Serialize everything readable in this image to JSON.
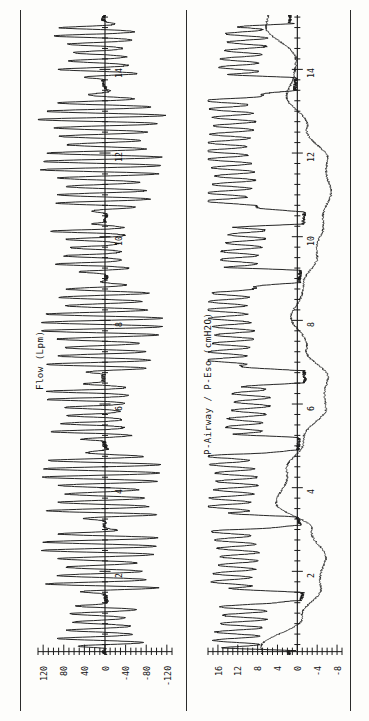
{
  "figure": {
    "kind": "physiological-recording",
    "orientation": "rotated-90-ccw",
    "background": "#fdfdfb",
    "ink": "#1a1a1a"
  },
  "panels": [
    {
      "id": "flow",
      "axis_title": "Flow (Lpm)",
      "amp_ticks": [
        "120",
        "80",
        "40",
        "0",
        "-40",
        "-80",
        "-120"
      ],
      "amp_tick_values": [
        120,
        80,
        40,
        0,
        -40,
        -80,
        -120
      ],
      "amp_minor_per_major": 4,
      "time_labels": [
        "2",
        "4",
        "6",
        "8",
        "10",
        "12",
        "14"
      ],
      "time_label_values": [
        2,
        4,
        6,
        8,
        10,
        12,
        14
      ]
    },
    {
      "id": "pressure",
      "axis_title": "P-Airway / P-Eso (cmH2O)",
      "amp_ticks": [
        "16",
        "12",
        "8",
        "4",
        "0",
        "-4",
        "-8"
      ],
      "amp_tick_values": [
        16,
        12,
        8,
        4,
        0,
        -4,
        -8
      ],
      "amp_minor_per_major": 4,
      "time_labels": [
        "2",
        "4",
        "6",
        "8",
        "10",
        "12",
        "14"
      ],
      "time_label_values": [
        2,
        4,
        6,
        8,
        10,
        12,
        14
      ]
    }
  ],
  "chart_data": {
    "type": "line",
    "title": "",
    "subtitle": "",
    "layout": {
      "panels": 2,
      "shared_axis": "time",
      "time_axis_orientation": "vertical-bottom-to-top",
      "amplitude_axis_orientation": "horizontal",
      "grid": false,
      "legend": "none",
      "frame": "left-and-right-vertical-rules"
    },
    "xlabel": "Time (s)",
    "xlim": [
      0,
      15.3
    ],
    "xticks": [
      2,
      4,
      6,
      8,
      10,
      12,
      14
    ],
    "panel_flow": {
      "ylabel": "Flow (Lpm)",
      "ylim": [
        -130,
        130
      ],
      "yticks": [
        -120,
        -80,
        -40,
        0,
        40,
        80,
        120
      ],
      "series": [
        {
          "name": "Flow",
          "description": "High-frequency oscillatory ventilation flow; bursts of ~5 Hz oscillation separated by quieter inter-burst segments. Amplitude modulated envelope.",
          "breath_bursts": [
            {
              "t_start": 0.15,
              "t_end": 1.25,
              "peak_pos": 95,
              "peak_neg": -70,
              "osc_hz": 5.1
            },
            {
              "t_start": 1.45,
              "t_end": 3.05,
              "peak_pos": 120,
              "peak_neg": -105,
              "osc_hz": 5.0
            },
            {
              "t_start": 3.2,
              "t_end": 4.95,
              "peak_pos": 118,
              "peak_neg": -112,
              "osc_hz": 5.0
            },
            {
              "t_start": 5.1,
              "t_end": 6.55,
              "peak_pos": 112,
              "peak_neg": -48,
              "osc_hz": 5.2
            },
            {
              "t_start": 6.7,
              "t_end": 8.95,
              "peak_pos": 122,
              "peak_neg": -116,
              "osc_hz": 5.0
            },
            {
              "t_start": 9.1,
              "t_end": 10.35,
              "peak_pos": 104,
              "peak_neg": -44,
              "osc_hz": 5.1
            },
            {
              "t_start": 10.55,
              "t_end": 13.55,
              "peak_pos": 120,
              "peak_neg": -114,
              "osc_hz": 5.0
            },
            {
              "t_start": 13.75,
              "t_end": 15.15,
              "peak_pos": 96,
              "peak_neg": -60,
              "osc_hz": 5.0
            }
          ]
        }
      ]
    },
    "panel_pressure": {
      "ylabel": "P-Airway / P-Eso (cmH2O)",
      "ylim": [
        -9,
        18
      ],
      "yticks": [
        -8,
        -4,
        0,
        4,
        8,
        12,
        16
      ],
      "series": [
        {
          "name": "P-Airway",
          "description": "Airway pressure: oscillating plateaus ~8-16 cmH2O during bursts, near 0 between bursts.",
          "plateau_segments": [
            {
              "t_start": 0.1,
              "t_end": 1.3,
              "level": 11.5,
              "osc_amp": 4.5
            },
            {
              "t_start": 1.5,
              "t_end": 3.1,
              "level": 12.5,
              "osc_amp": 4.0
            },
            {
              "t_start": 3.3,
              "t_end": 4.9,
              "level": 13.0,
              "osc_amp": 4.2
            },
            {
              "t_start": 5.2,
              "t_end": 6.5,
              "level": 10.0,
              "osc_amp": 3.6
            },
            {
              "t_start": 6.8,
              "t_end": 8.9,
              "level": 13.5,
              "osc_amp": 4.0
            },
            {
              "t_start": 9.2,
              "t_end": 10.3,
              "level": 11.0,
              "osc_amp": 3.8
            },
            {
              "t_start": 10.6,
              "t_end": 13.5,
              "level": 13.5,
              "osc_amp": 4.2
            },
            {
              "t_start": 13.8,
              "t_end": 15.1,
              "level": 11.0,
              "osc_amp": 4.0
            }
          ]
        },
        {
          "name": "P-Eso",
          "description": "Esophageal pressure: smooth slowly varying trace, dips negative (to about -6 cmH2O) during inspiratory efforts and rises toward 0 to +2 between efforts.",
          "envelope": [
            {
              "t": 0.2,
              "v": 7.0
            },
            {
              "t": 0.9,
              "v": -1.0
            },
            {
              "t": 1.6,
              "v": -4.5
            },
            {
              "t": 2.3,
              "v": -5.5
            },
            {
              "t": 3.0,
              "v": -3.0
            },
            {
              "t": 3.6,
              "v": 4.0
            },
            {
              "t": 4.4,
              "v": 2.0
            },
            {
              "t": 5.1,
              "v": -1.0
            },
            {
              "t": 5.9,
              "v": -5.5
            },
            {
              "t": 6.6,
              "v": -6.0
            },
            {
              "t": 7.3,
              "v": -2.0
            },
            {
              "t": 8.1,
              "v": 1.0
            },
            {
              "t": 8.9,
              "v": -1.5
            },
            {
              "t": 9.6,
              "v": -4.0
            },
            {
              "t": 10.3,
              "v": -5.0
            },
            {
              "t": 11.0,
              "v": -6.5
            },
            {
              "t": 11.8,
              "v": -6.0
            },
            {
              "t": 12.6,
              "v": -2.0
            },
            {
              "t": 13.4,
              "v": 2.0
            },
            {
              "t": 14.2,
              "v": 0.0
            },
            {
              "t": 15.0,
              "v": 6.0
            }
          ]
        }
      ]
    }
  }
}
